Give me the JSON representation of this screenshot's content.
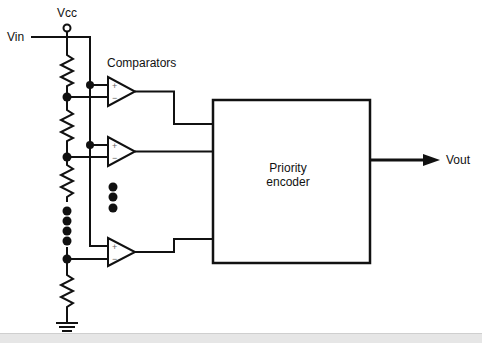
{
  "diagram": {
    "labels": {
      "vcc": "Vcc",
      "vin": "Vin",
      "comparators": "Comparators",
      "encoder_line1": "Priority",
      "encoder_line2": "encoder",
      "vout": "Vout"
    },
    "comparator_symbols": {
      "plus": "+",
      "minus": "−"
    },
    "components": {
      "resistors": 4,
      "comparators": 3,
      "ellipsis_ladder_dots": 4,
      "ellipsis_comparator_dots": 3,
      "terminals": [
        "Vcc",
        "Vin",
        "Vout",
        "Ground"
      ],
      "blocks": [
        "Priority encoder"
      ]
    },
    "colors": {
      "line": "#111111",
      "background": "#ffffff"
    }
  }
}
